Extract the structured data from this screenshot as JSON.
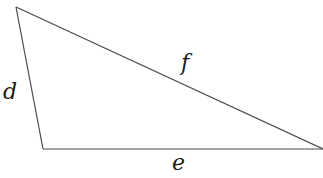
{
  "diagram": {
    "type": "triangle",
    "labels": {
      "left_side": "d",
      "hypotenuse": "f",
      "bottom_side": "e"
    },
    "colors": {
      "stroke": "#4a4a4a",
      "text": "#1a1a1a"
    }
  }
}
